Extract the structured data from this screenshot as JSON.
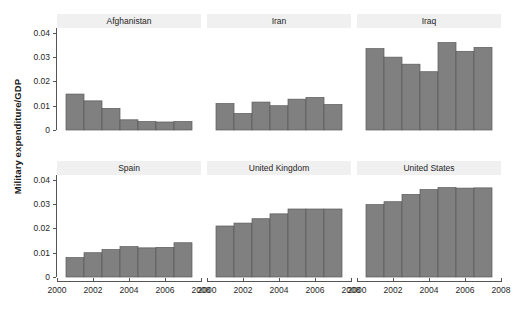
{
  "chart_data": {
    "type": "bar",
    "title": "",
    "xlabel": "",
    "ylabel": "Military expenditure/GDP",
    "layout": {
      "rows": 2,
      "cols": 3,
      "facet_style": "lattice-trellis",
      "grid": false,
      "legend": "none"
    },
    "xlim": [
      2000,
      2008
    ],
    "ylim": [
      0,
      0.042
    ],
    "yticks": [
      "0",
      "0.01",
      "0.02",
      "0.03",
      "0.04"
    ],
    "ytick_values": [
      0,
      0.01,
      0.02,
      0.03,
      0.04
    ],
    "xticks": [
      "2000",
      "2002",
      "2004",
      "2006",
      "2008"
    ],
    "xtick_values": [
      2000,
      2002,
      2004,
      2006,
      2008
    ],
    "x": [
      2001,
      2002,
      2003,
      2004,
      2005,
      2006,
      2007
    ],
    "bar_color": "#808080",
    "bar_border_color": "#5a5a5a",
    "strip_background": "#f0f0f0",
    "axis_color": "#555555",
    "panels": [
      {
        "name": "Afghanistan",
        "values": [
          0.0148,
          0.012,
          0.0089,
          0.0042,
          0.0035,
          0.0033,
          0.0035
        ]
      },
      {
        "name": "Iran",
        "values": [
          0.0109,
          0.0068,
          0.0115,
          0.01,
          0.0127,
          0.0134,
          0.0105
        ]
      },
      {
        "name": "Iraq",
        "values": [
          0.0335,
          0.03,
          0.0271,
          0.024,
          0.036,
          0.0324,
          0.034
        ]
      },
      {
        "name": "Spain",
        "values": [
          0.008,
          0.01,
          0.0113,
          0.0125,
          0.012,
          0.0122,
          0.0141
        ]
      },
      {
        "name": "United Kingdom",
        "values": [
          0.021,
          0.0222,
          0.024,
          0.026,
          0.028,
          0.028,
          0.028
        ]
      },
      {
        "name": "United States",
        "values": [
          0.0298,
          0.031,
          0.034,
          0.036,
          0.0368,
          0.0366,
          0.0367
        ]
      }
    ]
  }
}
